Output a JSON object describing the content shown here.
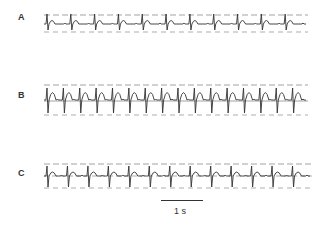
{
  "panels": [
    {
      "label": "A",
      "beats": 11,
      "rhythm": "regular"
    },
    {
      "label": "B",
      "beats": 16,
      "rhythm": "irregular, tall T waves"
    },
    {
      "label": "C",
      "beats": 13,
      "rhythm": "regular"
    }
  ],
  "scale": {
    "label": "1 s"
  },
  "colors": {
    "trace": "#333333",
    "grid": "#555555"
  }
}
